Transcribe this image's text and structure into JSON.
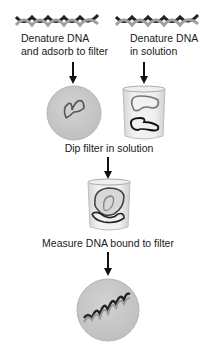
{
  "diagram": {
    "type": "flow",
    "steps": {
      "left_start": {
        "icon": "dna-double-helix-icon",
        "label_line1": "Denature DNA",
        "label_line2": "and adsorb to filter",
        "result_icon": "filter-with-single-strand-dna-icon"
      },
      "right_start": {
        "icon": "dna-double-helix-icon",
        "label_line1": "Denature DNA",
        "label_line2": "in solution",
        "result_icon": "beaker-with-single-strand-dna-icon"
      },
      "merge": {
        "label": "Dip filter in solution",
        "result_icon": "beaker-with-filter-icon"
      },
      "final": {
        "label": "Measure DNA bound to filter",
        "result_icon": "filter-with-hybridized-dna-icon"
      }
    },
    "colors": {
      "arrow": "#111111",
      "filter_fill": "#c9c9c9",
      "filter_edge": "#b0b0b0",
      "beaker_glass": "#e6e6e6",
      "dna_dark": "#222222",
      "dna_light": "#9a9a9a"
    }
  }
}
